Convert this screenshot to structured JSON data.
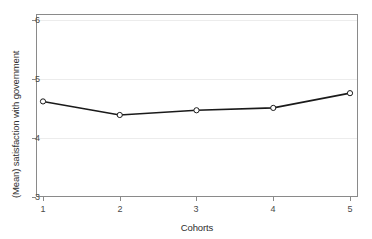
{
  "chart_data": {
    "type": "line",
    "title": "",
    "subtitle": "",
    "xlabel": "Cohorts",
    "ylabel": "(Mean) satisfaction with government",
    "x": [
      1,
      2,
      3,
      4,
      5
    ],
    "categories": [
      "1",
      "2",
      "3",
      "4",
      "5"
    ],
    "values": [
      4.62,
      4.39,
      4.47,
      4.51,
      4.76
    ],
    "series": [
      {
        "name": "(Mean) satisfaction with government",
        "values": [
          4.62,
          4.39,
          4.47,
          4.51,
          4.76
        ]
      }
    ],
    "xlim": [
      0.7,
      5.3
    ],
    "ylim": [
      3,
      6
    ],
    "xticks": [
      "1",
      "2",
      "3",
      "4",
      "5"
    ],
    "yticks": [
      "3",
      "4",
      "5",
      "6"
    ],
    "grid": "horizontal",
    "legend": "none",
    "marker": "open-circle",
    "line_color": "#1a1a1a",
    "marker_fill": "#ffffff",
    "marker_edge": "#1a1a1a",
    "grid_color": "#ececec",
    "frame_color": "#8a8a8a",
    "background": "#ffffff"
  },
  "axes": {
    "y_tick_labels": [
      "6",
      "5",
      "4",
      "3"
    ],
    "x_tick_labels": [
      "1",
      "2",
      "3",
      "4",
      "5"
    ],
    "y_axis_title": "(Mean) satisfaction with government",
    "x_axis_title": "Cohorts"
  }
}
